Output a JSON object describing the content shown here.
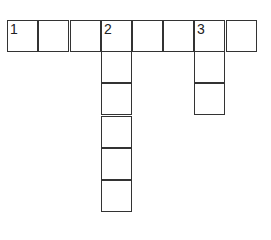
{
  "puzzle": {
    "type": "crossword",
    "cells": [
      {
        "x": 7,
        "y": 20,
        "number": "1"
      },
      {
        "x": 38,
        "y": 20,
        "number": ""
      },
      {
        "x": 70,
        "y": 20,
        "number": ""
      },
      {
        "x": 101,
        "y": 20,
        "number": "2"
      },
      {
        "x": 132,
        "y": 20,
        "number": ""
      },
      {
        "x": 163,
        "y": 20,
        "number": ""
      },
      {
        "x": 194,
        "y": 20,
        "number": "3"
      },
      {
        "x": 226,
        "y": 20,
        "number": ""
      },
      {
        "x": 101,
        "y": 51,
        "number": ""
      },
      {
        "x": 101,
        "y": 83,
        "number": ""
      },
      {
        "x": 101,
        "y": 116,
        "number": ""
      },
      {
        "x": 101,
        "y": 148,
        "number": ""
      },
      {
        "x": 101,
        "y": 180,
        "number": ""
      },
      {
        "x": 194,
        "y": 51,
        "number": ""
      },
      {
        "x": 194,
        "y": 83,
        "number": ""
      }
    ],
    "clues": {
      "across": [
        {
          "number": "1",
          "length": 8
        }
      ],
      "down": [
        {
          "number": "2",
          "length": 6
        },
        {
          "number": "3",
          "length": 3
        }
      ]
    }
  }
}
